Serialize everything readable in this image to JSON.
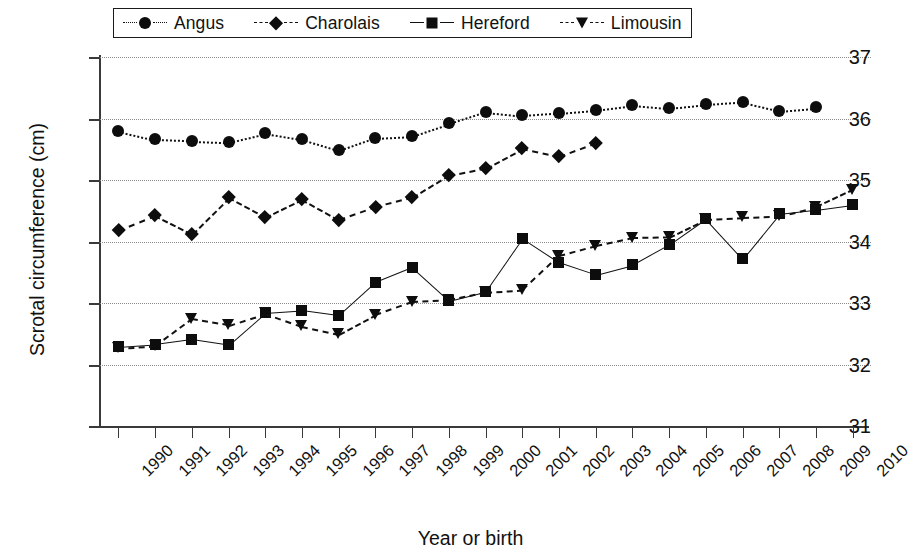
{
  "chart_data": {
    "type": "line",
    "title": "",
    "xlabel": "Year or birth",
    "ylabel": "Scrotal circumference (cm)",
    "xlim": [
      1989.5,
      2010.5
    ],
    "ylim": [
      31,
      37
    ],
    "yticks": [
      31,
      32,
      33,
      34,
      35,
      36,
      37
    ],
    "grid": true,
    "grid_axis": "y",
    "legend_position": "top",
    "x": [
      1990,
      1991,
      1992,
      1993,
      1994,
      1995,
      1996,
      1997,
      1998,
      1999,
      2000,
      2001,
      2002,
      2003,
      2004,
      2005,
      2006,
      2007,
      2008,
      2009,
      2010
    ],
    "categories": [
      "1990",
      "1991",
      "1992",
      "1993",
      "1994",
      "1995",
      "1996",
      "1997",
      "1998",
      "1999",
      "2000",
      "2001",
      "2002",
      "2003",
      "2004",
      "2005",
      "2006",
      "2007",
      "2008",
      "2009",
      "2010"
    ],
    "series": [
      {
        "name": "Angus",
        "marker": "circle",
        "linestyle": "dotted",
        "color": "#111111",
        "x": [
          1990,
          1991,
          1992,
          1993,
          1994,
          1995,
          1996,
          1997,
          1998,
          1999,
          2000,
          2001,
          2002,
          2003,
          2004,
          2005,
          2006,
          2007,
          2008,
          2009
        ],
        "values": [
          35.8,
          35.66,
          35.64,
          35.62,
          35.76,
          35.66,
          35.48,
          35.69,
          35.72,
          35.92,
          36.11,
          36.05,
          36.09,
          36.14,
          36.22,
          36.17,
          36.23,
          36.27,
          36.13,
          36.18
        ]
      },
      {
        "name": "Charolais",
        "marker": "diamond",
        "linestyle": "dashed",
        "color": "#111111",
        "x": [
          1990,
          1991,
          1992,
          1993,
          1994,
          1995,
          1996,
          1997,
          1998,
          1999,
          2000,
          2001,
          2002,
          2003
        ],
        "values": [
          34.19,
          34.43,
          34.13,
          34.72,
          34.4,
          34.69,
          34.36,
          34.57,
          34.72,
          35.08,
          35.2,
          35.52,
          35.39,
          35.61
        ]
      },
      {
        "name": "Hereford",
        "marker": "square",
        "linestyle": "solid",
        "color": "#111111",
        "x": [
          1990,
          1991,
          1992,
          1993,
          1994,
          1995,
          1996,
          1997,
          1998,
          1999,
          2000,
          2001,
          2002,
          2003,
          2004,
          2005,
          2006,
          2007,
          2008,
          2009,
          2010
        ],
        "values": [
          32.29,
          32.33,
          32.41,
          32.32,
          32.84,
          32.88,
          32.8,
          33.34,
          33.58,
          33.04,
          33.19,
          34.05,
          33.66,
          33.46,
          33.62,
          33.95,
          34.37,
          33.72,
          34.45,
          34.52,
          34.6
        ]
      },
      {
        "name": "Limousin",
        "marker": "triangle-down",
        "linestyle": "dashed",
        "color": "#111111",
        "x": [
          1990,
          1991,
          1992,
          1993,
          1994,
          1995,
          1996,
          1997,
          1998,
          1999,
          2000,
          2001,
          2002,
          2003,
          2004,
          2005,
          2006,
          2007,
          2008,
          2009,
          2010
        ],
        "values": [
          32.27,
          32.31,
          32.75,
          32.65,
          32.84,
          32.63,
          32.5,
          32.82,
          33.03,
          33.06,
          33.18,
          33.22,
          33.78,
          33.94,
          34.07,
          34.08,
          34.37,
          34.4,
          34.42,
          34.57,
          34.85
        ]
      }
    ]
  },
  "legend": {
    "entries": [
      {
        "label": "Angus",
        "marker": "circle",
        "linestyle": "dotted",
        "icon": "circle-marker-icon"
      },
      {
        "label": "Charolais",
        "marker": "diamond",
        "linestyle": "dashed",
        "icon": "diamond-marker-icon"
      },
      {
        "label": "Hereford",
        "marker": "square",
        "linestyle": "solid",
        "icon": "square-marker-icon"
      },
      {
        "label": "Limousin",
        "marker": "triangle-down",
        "linestyle": "dashed",
        "icon": "triangle-down-marker-icon"
      }
    ]
  },
  "axes": {
    "y_title": "Scrotal circumference (cm)",
    "x_title": "Year or birth",
    "y_tick_labels": [
      "37",
      "36",
      "35",
      "34",
      "33",
      "32",
      "31"
    ],
    "x_tick_labels": [
      "1990",
      "1991",
      "1992",
      "1993",
      "1994",
      "1995",
      "1996",
      "1997",
      "1998",
      "1999",
      "2000",
      "2001",
      "2002",
      "2003",
      "2004",
      "2005",
      "2006",
      "2007",
      "2008",
      "2009",
      "2010"
    ]
  },
  "colors": {
    "ink": "#111111",
    "axis": "#3a3a3a",
    "grid": "#8d8d8d",
    "background": "#ffffff"
  }
}
